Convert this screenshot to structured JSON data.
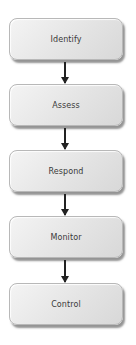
{
  "diagram": {
    "type": "vertical-flowchart",
    "steps": [
      {
        "label": "Identify"
      },
      {
        "label": "Assess"
      },
      {
        "label": "Respond"
      },
      {
        "label": "Monitor"
      },
      {
        "label": "Control"
      }
    ],
    "connectors": [
      {
        "from": "Identify",
        "to": "Assess"
      },
      {
        "from": "Assess",
        "to": "Respond"
      },
      {
        "from": "Respond",
        "to": "Monitor"
      },
      {
        "from": "Monitor",
        "to": "Control"
      }
    ],
    "colors": {
      "box_fill": "#e6e6e6",
      "box_border": "#b8b8b8",
      "text": "#3a3a3a",
      "arrow": "#222222"
    }
  }
}
